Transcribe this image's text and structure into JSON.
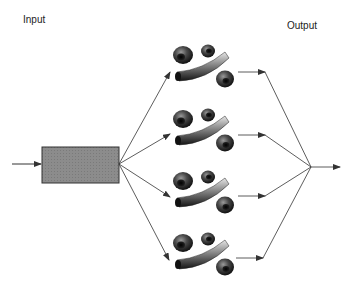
{
  "labels": {
    "input": "Input",
    "output": "Output"
  },
  "diagram": {
    "type": "parallel-processing flow",
    "source_box": {
      "shape": "rectangle",
      "fill": "#8a8a8a",
      "stroke": "#333333"
    },
    "branches": [
      {
        "id": 1,
        "contents": [
          "blob",
          "blob",
          "curved-rod",
          "blob"
        ]
      },
      {
        "id": 2,
        "contents": [
          "blob",
          "blob",
          "curved-rod",
          "blob"
        ]
      },
      {
        "id": 3,
        "contents": [
          "blob",
          "blob",
          "curved-rod",
          "blob"
        ]
      },
      {
        "id": 4,
        "contents": [
          "blob",
          "blob",
          "curved-rod",
          "blob"
        ]
      }
    ],
    "colors": {
      "line": "#333333",
      "object_dark": "#1a1a1a",
      "object_light": "#bfbfbf"
    }
  }
}
